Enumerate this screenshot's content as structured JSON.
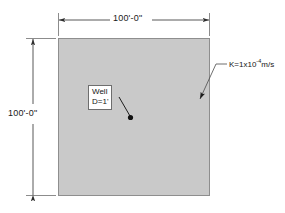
{
  "diagram": {
    "site": {
      "fill_color": "#c9c9c9",
      "border_color": "#8a8a8a",
      "shape": "square"
    },
    "dimensions": {
      "top": {
        "label": "100'-0\"",
        "orientation": "horizontal"
      },
      "left": {
        "label": "100'-0\"",
        "orientation": "vertical"
      },
      "line_color": "#3a3a3a"
    },
    "well_callout": {
      "line1": "Well",
      "line2": "D=1'",
      "marker": "filled-dot",
      "marker_color": "#111111"
    },
    "conductivity_note": {
      "prefix": "K=1x10",
      "exponent": "-4",
      "suffix": "m/s",
      "leader_color": "#555555"
    }
  }
}
